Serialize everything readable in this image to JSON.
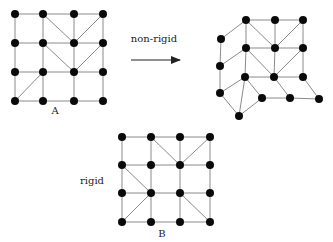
{
  "diagram": {
    "colors": {
      "node": "#0a0a0a",
      "edge": "#8a8a8a",
      "text": "#222222"
    },
    "node_radius": 4,
    "grids": [
      {
        "id": "A",
        "label": "A",
        "label_pos": [
          55,
          114
        ],
        "nodes": [
          [
            15,
            14
          ],
          [
            43,
            14
          ],
          [
            74,
            14
          ],
          [
            103,
            14
          ],
          [
            15,
            43
          ],
          [
            43,
            43
          ],
          [
            74,
            43
          ],
          [
            103,
            43
          ],
          [
            15,
            72
          ],
          [
            43,
            72
          ],
          [
            74,
            72
          ],
          [
            103,
            72
          ],
          [
            15,
            101
          ],
          [
            43,
            101
          ],
          [
            74,
            101
          ],
          [
            103,
            101
          ]
        ],
        "edges": [
          [
            0,
            1
          ],
          [
            1,
            2
          ],
          [
            2,
            3
          ],
          [
            4,
            5
          ],
          [
            5,
            6
          ],
          [
            6,
            7
          ],
          [
            8,
            9
          ],
          [
            9,
            10
          ],
          [
            10,
            11
          ],
          [
            12,
            13
          ],
          [
            13,
            14
          ],
          [
            14,
            15
          ],
          [
            0,
            4
          ],
          [
            4,
            8
          ],
          [
            8,
            12
          ],
          [
            1,
            5
          ],
          [
            5,
            9
          ],
          [
            9,
            13
          ],
          [
            2,
            6
          ],
          [
            6,
            10
          ],
          [
            10,
            14
          ],
          [
            3,
            7
          ],
          [
            7,
            11
          ],
          [
            11,
            15
          ],
          [
            1,
            6
          ],
          [
            3,
            6
          ],
          [
            5,
            10
          ],
          [
            7,
            10
          ],
          [
            9,
            12
          ]
        ]
      },
      {
        "id": "deformed",
        "label": "",
        "nodes": [
          [
            246,
            20
          ],
          [
            275,
            20
          ],
          [
            303,
            20
          ],
          [
            221,
            39
          ],
          [
            246,
            48
          ],
          [
            275,
            48
          ],
          [
            303,
            48
          ],
          [
            220,
            66
          ],
          [
            245,
            77
          ],
          [
            274,
            77
          ],
          [
            303,
            77
          ],
          [
            220,
            93
          ],
          [
            262,
            98
          ],
          [
            290,
            98
          ],
          [
            319,
            99
          ],
          [
            239,
            116
          ]
        ],
        "edges": [
          [
            0,
            1
          ],
          [
            1,
            2
          ],
          [
            0,
            4
          ],
          [
            1,
            5
          ],
          [
            2,
            6
          ],
          [
            0,
            5
          ],
          [
            2,
            5
          ],
          [
            3,
            0
          ],
          [
            3,
            7
          ],
          [
            7,
            11
          ],
          [
            7,
            4
          ],
          [
            4,
            5
          ],
          [
            5,
            6
          ],
          [
            4,
            8
          ],
          [
            5,
            9
          ],
          [
            6,
            10
          ],
          [
            4,
            9
          ],
          [
            6,
            9
          ],
          [
            8,
            9
          ],
          [
            9,
            10
          ],
          [
            11,
            8
          ],
          [
            11,
            15
          ],
          [
            8,
            15
          ],
          [
            8,
            12
          ],
          [
            12,
            15
          ],
          [
            12,
            13
          ],
          [
            13,
            14
          ],
          [
            9,
            13
          ],
          [
            10,
            14
          ]
        ]
      },
      {
        "id": "B",
        "label": "B",
        "label_pos": [
          162,
          237
        ],
        "nodes": [
          [
            122,
            137
          ],
          [
            151,
            137
          ],
          [
            180,
            137
          ],
          [
            210,
            137
          ],
          [
            122,
            165
          ],
          [
            151,
            165
          ],
          [
            180,
            165
          ],
          [
            210,
            165
          ],
          [
            122,
            193
          ],
          [
            151,
            193
          ],
          [
            180,
            193
          ],
          [
            210,
            193
          ],
          [
            122,
            222
          ],
          [
            151,
            222
          ],
          [
            180,
            222
          ],
          [
            210,
            222
          ]
        ],
        "edges": [
          [
            0,
            1
          ],
          [
            1,
            2
          ],
          [
            2,
            3
          ],
          [
            4,
            5
          ],
          [
            5,
            6
          ],
          [
            6,
            7
          ],
          [
            8,
            9
          ],
          [
            9,
            10
          ],
          [
            10,
            11
          ],
          [
            12,
            13
          ],
          [
            13,
            14
          ],
          [
            14,
            15
          ],
          [
            0,
            4
          ],
          [
            4,
            8
          ],
          [
            8,
            12
          ],
          [
            1,
            5
          ],
          [
            5,
            9
          ],
          [
            9,
            13
          ],
          [
            2,
            6
          ],
          [
            6,
            10
          ],
          [
            10,
            14
          ],
          [
            3,
            7
          ],
          [
            7,
            11
          ],
          [
            11,
            15
          ],
          [
            1,
            6
          ],
          [
            3,
            6
          ],
          [
            4,
            9
          ],
          [
            9,
            12
          ],
          [
            10,
            15
          ]
        ]
      }
    ],
    "arrow": {
      "label": "non-rigid",
      "from": [
        131,
        60
      ],
      "to": [
        180,
        60
      ],
      "label_pos": [
        154,
        42
      ]
    },
    "rigid_label": {
      "text": "rigid",
      "pos": [
        92,
        184
      ]
    }
  }
}
